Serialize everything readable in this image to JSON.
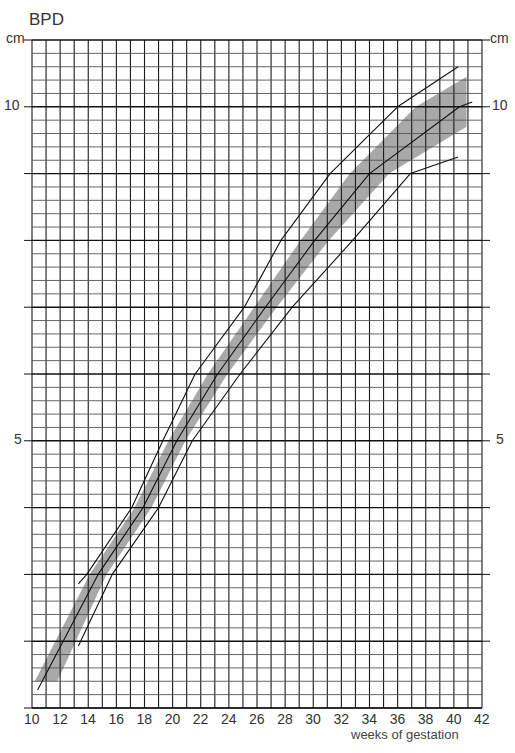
{
  "chart_data": {
    "type": "line",
    "title": "BPD",
    "xlabel": "weeks of gestation",
    "ylabel": "cm",
    "xlim": [
      10,
      42
    ],
    "ylim": [
      1,
      11
    ],
    "x_ticks": [
      10,
      12,
      14,
      16,
      18,
      20,
      22,
      24,
      26,
      28,
      30,
      32,
      34,
      36,
      38,
      40,
      42
    ],
    "y_tick_labels": [
      {
        "value": 10,
        "label": "10"
      },
      {
        "value": 5,
        "label": "5"
      }
    ],
    "y_unit_label": "cm",
    "grid": {
      "x_step": 1,
      "y_minor_step": 0.2,
      "y_major_step": 1
    },
    "series": [
      {
        "name": "upper limit",
        "style": "thin line",
        "points": [
          [
            13.3,
            2.86
          ],
          [
            13.9,
            3.0
          ],
          [
            17.1,
            4.0
          ],
          [
            19.3,
            5.0
          ],
          [
            21.6,
            6.0
          ],
          [
            25.1,
            7.0
          ],
          [
            27.7,
            8.0
          ],
          [
            31.2,
            9.0
          ],
          [
            36.0,
            10.0
          ],
          [
            40.3,
            10.6
          ]
        ]
      },
      {
        "name": "median",
        "style": "line",
        "points": [
          [
            10.4,
            1.27
          ],
          [
            14.7,
            3.0
          ],
          [
            17.9,
            4.0
          ],
          [
            20.3,
            5.0
          ],
          [
            23.2,
            6.0
          ],
          [
            26.6,
            7.0
          ],
          [
            30.1,
            8.0
          ],
          [
            34.0,
            9.0
          ],
          [
            40.4,
            10.0
          ],
          [
            41.3,
            10.07
          ]
        ]
      },
      {
        "name": "lower limit",
        "style": "thin line",
        "points": [
          [
            13.3,
            1.93
          ],
          [
            15.7,
            3.0
          ],
          [
            19.0,
            4.0
          ],
          [
            21.4,
            5.0
          ],
          [
            24.8,
            6.0
          ],
          [
            28.5,
            7.0
          ],
          [
            32.8,
            8.0
          ],
          [
            36.9,
            9.0
          ],
          [
            40.3,
            9.25
          ]
        ]
      }
    ],
    "band": {
      "name": "shaded normal range",
      "color": "#a9a9a9",
      "upper": [
        [
          10.2,
          1.4
        ],
        [
          14.1,
          3.0
        ],
        [
          17.3,
          4.0
        ],
        [
          19.7,
          5.0
        ],
        [
          22.5,
          6.0
        ],
        [
          25.8,
          7.0
        ],
        [
          29.1,
          8.0
        ],
        [
          32.6,
          9.0
        ],
        [
          37.3,
          10.0
        ],
        [
          40.9,
          10.45
        ]
      ],
      "lower": [
        [
          11.8,
          1.4
        ],
        [
          15.3,
          3.0
        ],
        [
          18.5,
          4.0
        ],
        [
          20.9,
          5.0
        ],
        [
          23.9,
          6.0
        ],
        [
          27.4,
          7.0
        ],
        [
          31.1,
          8.0
        ],
        [
          35.4,
          9.0
        ],
        [
          40.9,
          9.7
        ]
      ]
    }
  }
}
